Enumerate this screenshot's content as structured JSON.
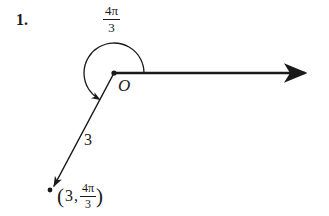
{
  "page": {
    "width": 329,
    "height": 216,
    "background_color": "#ffffff",
    "ink_color": "#1a1a1a"
  },
  "problem": {
    "number_label": "1."
  },
  "diagram": {
    "type": "polar-coordinate-diagram",
    "origin_label": "O",
    "radius_label": "3",
    "angle": {
      "numerator": "4π",
      "denominator": "3",
      "text": "4π/3"
    },
    "point": {
      "open_paren": "(",
      "r_value": "3",
      "separator": ",",
      "theta_numerator": "4π",
      "theta_denominator": "3",
      "close_paren": ")",
      "text": "(3, 4π/3)"
    },
    "geometry": {
      "origin": [
        114,
        73
      ],
      "polar_axis_end": [
        313,
        73
      ],
      "terminal_point": [
        51,
        190
      ],
      "arc_radius": 30,
      "arc_start_angle_deg": 0,
      "arc_end_angle_deg": 240,
      "arc_direction": "counterclockwise"
    }
  }
}
